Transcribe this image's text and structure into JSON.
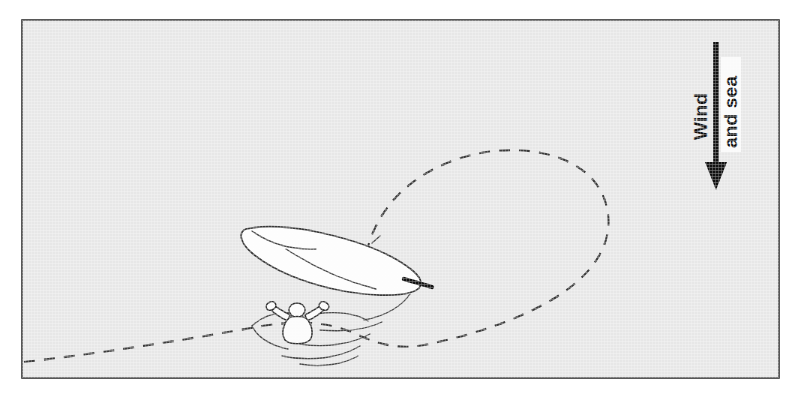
{
  "figure": {
    "background_color": "#e7e7e7",
    "frame_color": "#2e2e2e",
    "ink_color": "#3a3a3a",
    "hull_fill": "#fdfdfd"
  },
  "annotations": {
    "wind_label": "Wind",
    "sea_label": "and sea",
    "arrow": {
      "name": "wind-and-sea-direction-arrow",
      "direction": "down",
      "color": "#111111"
    }
  },
  "elements": {
    "hull": {
      "name": "capsized-hull",
      "description": "inverted boat hull"
    },
    "rudder": {
      "name": "rudder-blade",
      "description": "dark rudder at stern"
    },
    "swimmer": {
      "name": "person-in-water",
      "description": "crew member floating with arms outstretched"
    },
    "ripples": {
      "name": "water-ripples",
      "description": "concentric ripple arcs around the swimmer"
    },
    "track": {
      "name": "dashed-track-path",
      "description": "dashed line showing the boat's track looping back"
    }
  }
}
